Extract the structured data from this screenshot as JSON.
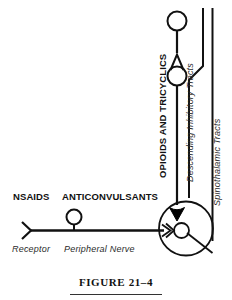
{
  "figure": {
    "caption": "FIGURE 21–4",
    "stroke_color": "#111111",
    "fill_color": "#000000",
    "background": "#ffffff"
  },
  "labels": {
    "opioids_and_tricyclics": "OPIOIDS AND TRICYCLICS",
    "descending_inhibitory_tracts": "Descending Inhibitory Tracts",
    "spinothalamic_tracts": "Spinothalamic Tracts",
    "nsaids": "NSAIDS",
    "anticonvulsants": "ANTICONVULSANTS",
    "receptor": "Receptor",
    "peripheral_nerve": "Peripheral Nerve"
  },
  "diagram": {
    "type": "pain-pathway-schematic",
    "elements": [
      {
        "name": "top-neuron-cell-body",
        "shape": "circle",
        "cx": 177,
        "cy": 21,
        "r": 9
      },
      {
        "name": "ascending-axon",
        "shape": "line",
        "x1": 177,
        "y1": 30,
        "x2": 177,
        "y2": 52
      },
      {
        "name": "open-synapse-arrowhead",
        "shape": "v-chevron",
        "cx": 177,
        "cy": 62
      },
      {
        "name": "second-order-cell-body",
        "shape": "circle",
        "cx": 177,
        "cy": 75,
        "r": 9
      },
      {
        "name": "second-order-axon",
        "shape": "line",
        "x1": 177,
        "y1": 84,
        "x2": 177,
        "y2": 205
      },
      {
        "name": "descending-tract-line",
        "shape": "polyline",
        "points": "203,8 203,68 188,80 188,196"
      },
      {
        "name": "spinothalamic-tract-line",
        "shape": "line",
        "x1": 212,
        "y1": 8,
        "x2": 212,
        "y2": 238
      },
      {
        "name": "spinal-cord-circle",
        "shape": "circle",
        "cx": 186,
        "cy": 228,
        "r": 27
      },
      {
        "name": "filled-terminal-bouton",
        "shape": "filled-triangle",
        "cx": 177,
        "cy": 214
      },
      {
        "name": "dorsal-horn-cell-body",
        "shape": "circle",
        "cx": 181,
        "cy": 230,
        "r": 7
      },
      {
        "name": "afferent-terminal-arrowhead",
        "shape": "open-arrow",
        "cx": 169,
        "cy": 230
      },
      {
        "name": "peripheral-nerve-axon",
        "shape": "line",
        "x1": 30,
        "y1": 230,
        "x2": 166,
        "y2": 230
      },
      {
        "name": "nerve-cell-body",
        "shape": "circle",
        "cx": 74,
        "cy": 218,
        "r": 7
      },
      {
        "name": "nerve-cell-stem",
        "shape": "line",
        "x1": 74,
        "y1": 225,
        "x2": 74,
        "y2": 230
      },
      {
        "name": "receptor-chevron",
        "shape": "chevron",
        "cx": 30,
        "cy": 230
      },
      {
        "name": "relay-diagonal",
        "shape": "line",
        "x1": 187,
        "y1": 233,
        "x2": 212,
        "y2": 253
      }
    ]
  }
}
